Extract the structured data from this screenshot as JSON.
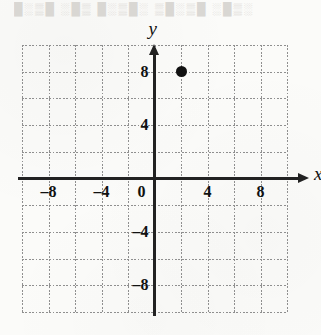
{
  "figure": {
    "background_color": "#fbfbf9",
    "axis_color": "#222222",
    "grid_color": "#8f8f8f",
    "point_color": "#111111",
    "scan_bleed_text": "█░▒█ ░█▒ █░▒█░ ▒█░▒█ ░█▒░"
  },
  "chart_data": {
    "type": "scatter",
    "title": "",
    "xlabel": "x",
    "ylabel": "y",
    "xlim": [
      -10,
      10
    ],
    "ylim": [
      -10,
      10
    ],
    "grid": true,
    "grid_step": 2,
    "legend": "none",
    "xticks": [
      -8,
      -4,
      0,
      4,
      8
    ],
    "yticks": [
      8,
      4,
      -4,
      -8
    ],
    "xtick_labels": [
      "–8",
      "–4",
      "0",
      "4",
      "8"
    ],
    "ytick_labels": [
      "8",
      "4",
      "–4",
      "–8"
    ],
    "origin_label": "0",
    "points": [
      {
        "label": "plotted-point",
        "x": 2,
        "y": 8
      }
    ]
  }
}
